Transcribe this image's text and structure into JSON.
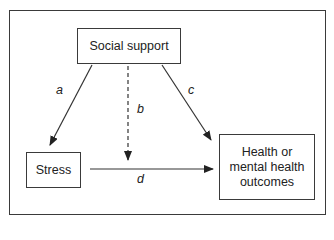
{
  "nodes": {
    "social_support": "Social support",
    "stress": "Stress",
    "outcome_line1": "Health or",
    "outcome_line2": "mental health",
    "outcome_line3": "outcomes"
  },
  "paths": {
    "a": "a",
    "b": "b",
    "c": "c",
    "d": "d"
  },
  "colors": {
    "stroke": "#3a3a3a",
    "text": "#222222"
  }
}
